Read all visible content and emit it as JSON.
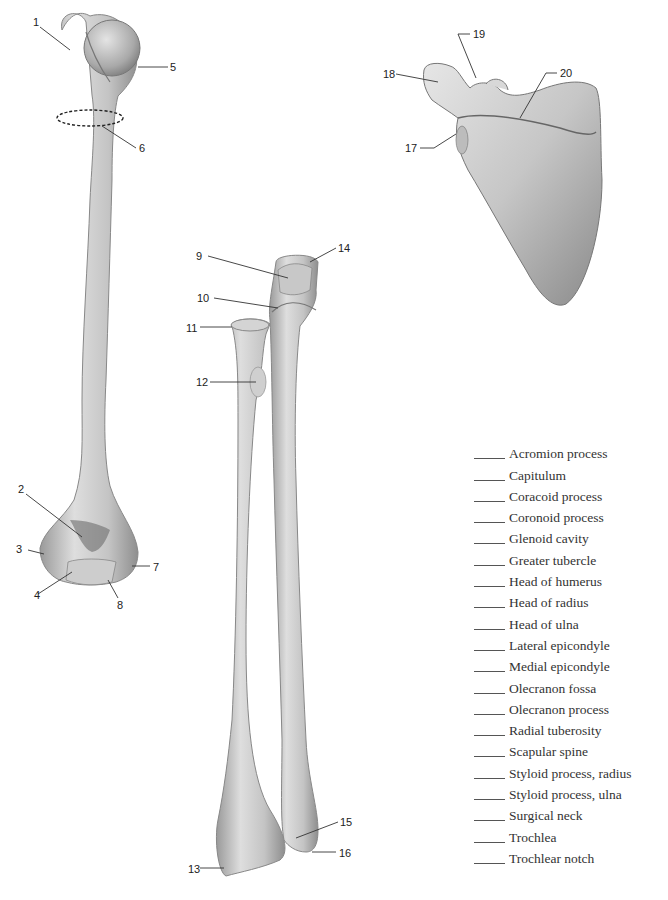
{
  "figure": {
    "bones": [
      "humerus",
      "radius",
      "ulna",
      "scapula"
    ]
  },
  "callouts": [
    {
      "number": "1",
      "x": 33,
      "y": 17
    },
    {
      "number": "2",
      "x": 18,
      "y": 484
    },
    {
      "number": "3",
      "x": 16,
      "y": 544
    },
    {
      "number": "4",
      "x": 34,
      "y": 590
    },
    {
      "number": "5",
      "x": 170,
      "y": 62
    },
    {
      "number": "6",
      "x": 139,
      "y": 143
    },
    {
      "number": "7",
      "x": 153,
      "y": 562
    },
    {
      "number": "8",
      "x": 117,
      "y": 600
    },
    {
      "number": "9",
      "x": 196,
      "y": 251
    },
    {
      "number": "10",
      "x": 197,
      "y": 293
    },
    {
      "number": "11",
      "x": 186,
      "y": 323
    },
    {
      "number": "12",
      "x": 196,
      "y": 377
    },
    {
      "number": "13",
      "x": 188,
      "y": 864
    },
    {
      "number": "14",
      "x": 338,
      "y": 243
    },
    {
      "number": "15",
      "x": 340,
      "y": 817
    },
    {
      "number": "16",
      "x": 339,
      "y": 848
    },
    {
      "number": "17",
      "x": 405,
      "y": 143
    },
    {
      "number": "18",
      "x": 383,
      "y": 69
    },
    {
      "number": "19",
      "x": 473,
      "y": 29
    },
    {
      "number": "20",
      "x": 560,
      "y": 68
    }
  ],
  "answer_list": {
    "blank": "_____",
    "terms": [
      "Acromion process",
      "Capitulum",
      "Coracoid process",
      "Coronoid process",
      "Glenoid cavity",
      "Greater tubercle",
      "Head of humerus",
      "Head of radius",
      "Head of ulna",
      "Lateral epicondyle",
      "Medial epicondyle",
      "Olecranon fossa",
      "Olecranon process",
      "Radial tuberosity",
      "Scapular spine",
      "Styloid process, radius",
      "Styloid process, ulna",
      "Surgical neck",
      "Trochlea",
      "Trochlear notch"
    ]
  },
  "colors": {
    "bone_light": "#d8d8d8",
    "bone_mid": "#b4b4b4",
    "bone_dark": "#7a7a7a",
    "leader_line": "#333333",
    "text": "#222222"
  }
}
